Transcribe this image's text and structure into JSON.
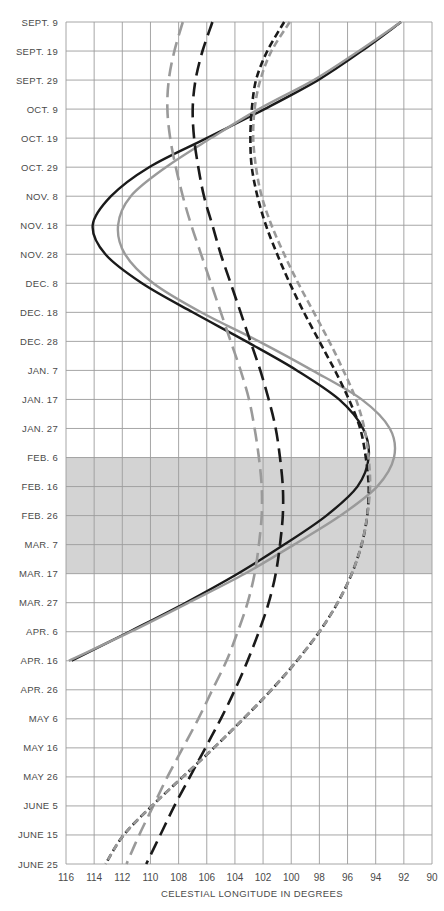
{
  "chart_data": {
    "type": "line",
    "title": "",
    "xlabel": "CELESTIAL LONGITUDE IN DEGREES",
    "ylabel": "",
    "x_axis": {
      "ticks": [
        116,
        114,
        112,
        110,
        108,
        106,
        104,
        102,
        100,
        98,
        96,
        94,
        92,
        90
      ],
      "range": [
        116,
        90
      ],
      "reversed": true
    },
    "y_axis": {
      "ticks": [
        "SEPT. 9",
        "SEPT. 19",
        "SEPT. 29",
        "OCT. 9",
        "OCT. 19",
        "OCT. 29",
        "NOV. 8",
        "NOV. 18",
        "NOV. 28",
        "DEC. 8",
        "DEC. 18",
        "DEC. 28",
        "JAN. 7",
        "JAN. 17",
        "JAN. 27",
        "FEB. 6",
        "FEB. 16",
        "FEB. 26",
        "MAR. 7",
        "MAR. 17",
        "MAR. 27",
        "APR. 6",
        "APR. 16",
        "APR. 26",
        "MAY 6",
        "MAY 16",
        "MAY 26",
        "JUNE 5",
        "JUNE 15",
        "JUNE 25"
      ],
      "direction": "top-to-bottom"
    },
    "grid": true,
    "shaded_region": {
      "from": "FEB. 6",
      "to": "MAR. 17",
      "color": "#d3d3d3"
    },
    "series": [
      {
        "name": "solid-black",
        "style": "solid",
        "color": "#1a1a1a",
        "points": [
          [
            "SEPT. 9",
            92.2
          ],
          [
            "SEPT. 19",
            95.0
          ],
          [
            "SEPT. 29",
            98.1
          ],
          [
            "OCT. 9",
            101.9
          ],
          [
            "OCT. 19",
            106.0
          ],
          [
            "OCT. 29",
            110.1
          ],
          [
            "NOV. 8",
            112.8
          ],
          [
            "NOV. 18",
            114.1
          ],
          [
            "NOV. 28",
            113.2
          ],
          [
            "DEC. 8",
            110.6
          ],
          [
            "DEC. 18",
            107.0
          ],
          [
            "DEC. 28",
            103.2
          ],
          [
            "JAN. 7",
            99.6
          ],
          [
            "JAN. 17",
            96.6
          ],
          [
            "JAN. 27",
            94.9
          ],
          [
            "FEB. 6",
            94.5
          ],
          [
            "FEB. 16",
            95.3
          ],
          [
            "FEB. 26",
            97.5
          ],
          [
            "MAR. 7",
            100.5
          ],
          [
            "MAR. 17",
            103.8
          ],
          [
            "MAR. 27",
            107.5
          ],
          [
            "APR. 6",
            111.5
          ],
          [
            "APR. 16",
            115.6
          ]
        ]
      },
      {
        "name": "solid-gray",
        "style": "solid",
        "color": "#9a9a9a",
        "points": [
          [
            "SEPT. 9",
            92.2
          ],
          [
            "SEPT. 19",
            95.2
          ],
          [
            "SEPT. 29",
            98.4
          ],
          [
            "OCT. 9",
            102.3
          ],
          [
            "OCT. 19",
            105.7
          ],
          [
            "OCT. 29",
            108.9
          ],
          [
            "NOV. 8",
            111.4
          ],
          [
            "NOV. 18",
            112.3
          ],
          [
            "NOV. 28",
            111.8
          ],
          [
            "DEC. 8",
            109.8
          ],
          [
            "DEC. 18",
            106.4
          ],
          [
            "DEC. 28",
            102.3
          ],
          [
            "JAN. 7",
            98.5
          ],
          [
            "JAN. 17",
            95.0
          ],
          [
            "JAN. 27",
            93.0
          ],
          [
            "FEB. 6",
            92.7
          ],
          [
            "FEB. 16",
            93.9
          ],
          [
            "FEB. 26",
            96.5
          ],
          [
            "MAR. 7",
            99.8
          ],
          [
            "MAR. 17",
            103.3
          ],
          [
            "MAR. 27",
            107.3
          ],
          [
            "APR. 6",
            111.4
          ],
          [
            "APR. 16",
            115.8
          ]
        ]
      },
      {
        "name": "long-dash-black",
        "style": "long-dash",
        "color": "#1a1a1a",
        "points": [
          [
            "SEPT. 9",
            105.6
          ],
          [
            "SEPT. 19",
            106.3
          ],
          [
            "SEPT. 29",
            106.8
          ],
          [
            "OCT. 9",
            107.0
          ],
          [
            "OCT. 19",
            106.9
          ],
          [
            "OCT. 29",
            106.6
          ],
          [
            "NOV. 8",
            106.2
          ],
          [
            "NOV. 18",
            105.6
          ],
          [
            "NOV. 28",
            105.0
          ],
          [
            "DEC. 8",
            104.3
          ],
          [
            "DEC. 18",
            103.6
          ],
          [
            "DEC. 28",
            102.9
          ],
          [
            "JAN. 7",
            102.2
          ],
          [
            "JAN. 17",
            101.6
          ],
          [
            "JAN. 27",
            101.1
          ],
          [
            "FEB. 6",
            100.8
          ],
          [
            "FEB. 16",
            100.6
          ],
          [
            "FEB. 26",
            100.6
          ],
          [
            "MAR. 7",
            100.8
          ],
          [
            "MAR. 17",
            101.1
          ],
          [
            "MAR. 27",
            101.6
          ],
          [
            "APR. 6",
            102.3
          ],
          [
            "APR. 16",
            103.1
          ],
          [
            "APR. 26",
            104.0
          ],
          [
            "MAY 6",
            105.0
          ],
          [
            "MAY 16",
            106.1
          ],
          [
            "MAY 26",
            107.2
          ],
          [
            "JUNE 5",
            108.3
          ],
          [
            "JUNE 15",
            109.3
          ],
          [
            "JUNE 25",
            110.3
          ]
        ]
      },
      {
        "name": "long-dash-gray",
        "style": "long-dash",
        "color": "#9a9a9a",
        "points": [
          [
            "SEPT. 9",
            107.7
          ],
          [
            "SEPT. 19",
            108.3
          ],
          [
            "SEPT. 29",
            108.7
          ],
          [
            "OCT. 9",
            108.8
          ],
          [
            "OCT. 19",
            108.6
          ],
          [
            "OCT. 29",
            108.2
          ],
          [
            "NOV. 8",
            107.7
          ],
          [
            "NOV. 18",
            107.1
          ],
          [
            "NOV. 28",
            106.4
          ],
          [
            "DEC. 8",
            105.7
          ],
          [
            "DEC. 18",
            105.0
          ],
          [
            "DEC. 28",
            104.3
          ],
          [
            "JAN. 7",
            103.6
          ],
          [
            "JAN. 17",
            103.0
          ],
          [
            "JAN. 27",
            102.6
          ],
          [
            "FEB. 6",
            102.3
          ],
          [
            "FEB. 16",
            102.1
          ],
          [
            "FEB. 26",
            102.1
          ],
          [
            "MAR. 7",
            102.3
          ],
          [
            "MAR. 17",
            102.6
          ],
          [
            "MAR. 27",
            103.1
          ],
          [
            "APR. 6",
            103.8
          ],
          [
            "APR. 16",
            104.6
          ],
          [
            "APR. 26",
            105.6
          ],
          [
            "MAY 6",
            106.6
          ],
          [
            "MAY 16",
            107.7
          ],
          [
            "MAY 26",
            108.8
          ],
          [
            "JUNE 5",
            109.8
          ],
          [
            "JUNE 15",
            110.8
          ],
          [
            "JUNE 25",
            111.7
          ]
        ]
      },
      {
        "name": "short-dash-black",
        "style": "short-dash",
        "color": "#1a1a1a",
        "points": [
          [
            "SEPT. 9",
            100.5
          ],
          [
            "SEPT. 19",
            101.7
          ],
          [
            "SEPT. 29",
            102.5
          ],
          [
            "OCT. 9",
            102.8
          ],
          [
            "OCT. 19",
            102.9
          ],
          [
            "OCT. 29",
            102.8
          ],
          [
            "NOV. 8",
            102.4
          ],
          [
            "NOV. 18",
            101.8
          ],
          [
            "NOV. 28",
            101.0
          ],
          [
            "DEC. 8",
            100.1
          ],
          [
            "DEC. 18",
            99.1
          ],
          [
            "DEC. 28",
            98.0
          ],
          [
            "JAN. 7",
            96.9
          ],
          [
            "JAN. 17",
            95.9
          ],
          [
            "JAN. 27",
            95.1
          ],
          [
            "FEB. 6",
            94.7
          ],
          [
            "FEB. 16",
            94.5
          ],
          [
            "FEB. 26",
            94.6
          ],
          [
            "MAR. 7",
            95.0
          ],
          [
            "MAR. 17",
            95.7
          ],
          [
            "MAR. 27",
            96.7
          ],
          [
            "APR. 6",
            98.0
          ],
          [
            "APR. 16",
            99.6
          ],
          [
            "APR. 26",
            101.4
          ],
          [
            "MAY 6",
            103.4
          ],
          [
            "MAY 16",
            105.5
          ],
          [
            "MAY 26",
            107.7
          ],
          [
            "JUNE 5",
            109.9
          ],
          [
            "JUNE 15",
            111.9
          ],
          [
            "JUNE 25",
            113.2
          ]
        ]
      },
      {
        "name": "short-dash-gray",
        "style": "short-dash",
        "color": "#9a9a9a",
        "points": [
          [
            "SEPT. 9",
            100.1
          ],
          [
            "SEPT. 19",
            101.4
          ],
          [
            "SEPT. 29",
            102.2
          ],
          [
            "OCT. 9",
            102.6
          ],
          [
            "OCT. 19",
            102.7
          ],
          [
            "OCT. 29",
            102.5
          ],
          [
            "NOV. 8",
            102.1
          ],
          [
            "NOV. 18",
            101.4
          ],
          [
            "NOV. 28",
            100.5
          ],
          [
            "DEC. 8",
            99.5
          ],
          [
            "DEC. 18",
            98.4
          ],
          [
            "DEC. 28",
            97.3
          ],
          [
            "JAN. 7",
            96.3
          ],
          [
            "JAN. 17",
            95.4
          ],
          [
            "JAN. 27",
            94.8
          ],
          [
            "FEB. 6",
            94.5
          ],
          [
            "FEB. 16",
            94.4
          ],
          [
            "FEB. 26",
            94.6
          ],
          [
            "MAR. 7",
            95.0
          ],
          [
            "MAR. 17",
            95.7
          ],
          [
            "MAR. 27",
            96.7
          ],
          [
            "APR. 6",
            98.0
          ],
          [
            "APR. 16",
            99.6
          ],
          [
            "APR. 26",
            101.4
          ],
          [
            "MAY 6",
            103.4
          ],
          [
            "MAY 16",
            105.5
          ],
          [
            "MAY 26",
            107.7
          ],
          [
            "JUNE 5",
            109.9
          ],
          [
            "JUNE 15",
            111.9
          ],
          [
            "JUNE 25",
            113.2
          ]
        ]
      }
    ]
  },
  "layout": {
    "plot_left": 66,
    "plot_right": 432,
    "plot_top": 22,
    "plot_bottom": 864,
    "grid_color": "#9c9c9c",
    "label_color": "#4a4a4a"
  }
}
